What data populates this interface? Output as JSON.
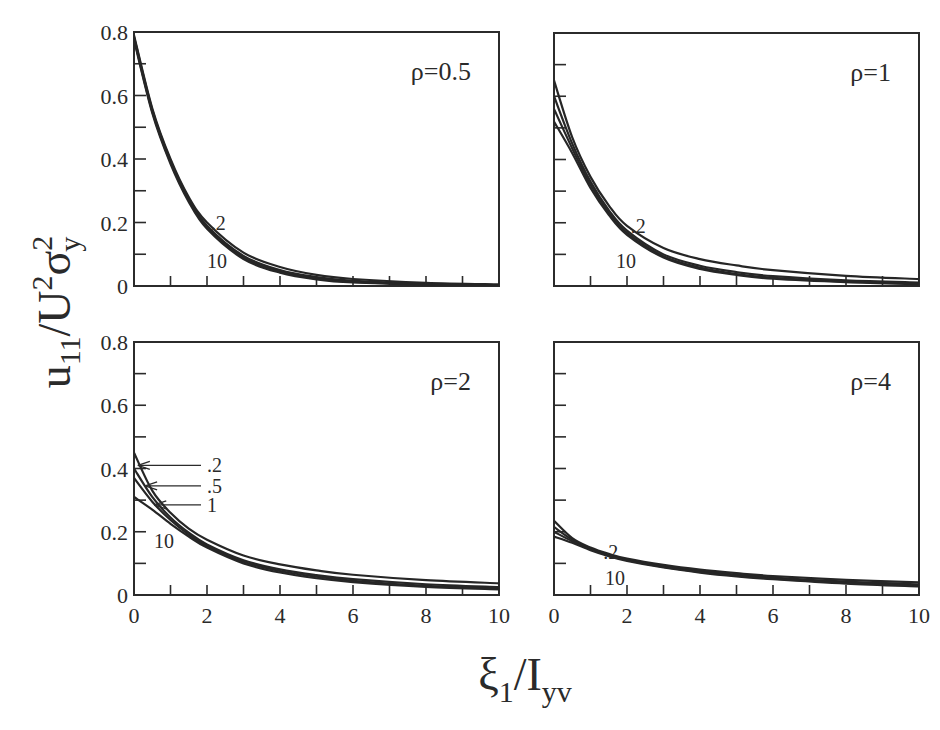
{
  "chart_data": {
    "type": "line",
    "title": "",
    "xlabel": {
      "main": "ξ",
      "sub1": "1",
      "slash": "/I",
      "sub2": "yv"
    },
    "ylabel": {
      "main": "u",
      "sub1": "11",
      "slash": "/U",
      "sup1": "2",
      "sigma": "σ",
      "sup2": "2",
      "sub2": "y"
    },
    "xlim": [
      0,
      10
    ],
    "ylim": [
      0,
      0.8
    ],
    "x_ticks": [
      0,
      2,
      4,
      6,
      8,
      10
    ],
    "x_tick_labels": [
      "0",
      "2",
      "4",
      "6",
      "8",
      "10"
    ],
    "x_minor_ticks": [
      1,
      3,
      5,
      7,
      9
    ],
    "y_ticks": [
      0,
      0.2,
      0.4,
      0.6,
      0.8
    ],
    "y_tick_labels": [
      "0",
      "0.2",
      "0.4",
      "0.6",
      "0.8"
    ],
    "y_minor_ticks": [
      0.1,
      0.3,
      0.5,
      0.7
    ],
    "grid": false,
    "layout": "2x2 shared axes",
    "panels": [
      {
        "id": "rho-0.5",
        "label": "ρ=0.5",
        "position": "top-left",
        "series": [
          {
            "name": ".2",
            "x": [
              0,
              0.5,
              1,
              1.5,
              2,
              3,
              4,
              5,
              6,
              8,
              10
            ],
            "y": [
              0.79,
              0.56,
              0.4,
              0.28,
              0.2,
              0.105,
              0.06,
              0.035,
              0.022,
              0.01,
              0.005
            ]
          },
          {
            "name": ".5",
            "x": [
              0,
              0.5,
              1,
              1.5,
              2,
              3,
              4,
              5,
              6,
              8,
              10
            ],
            "y": [
              0.785,
              0.555,
              0.395,
              0.275,
              0.19,
              0.095,
              0.05,
              0.028,
              0.016,
              0.007,
              0.003
            ]
          },
          {
            "name": "1",
            "x": [
              0,
              0.5,
              1,
              1.5,
              2,
              3,
              4,
              5,
              6,
              8,
              10
            ],
            "y": [
              0.78,
              0.55,
              0.39,
              0.27,
              0.185,
              0.09,
              0.046,
              0.024,
              0.013,
              0.005,
              0.002
            ]
          },
          {
            "name": "10",
            "x": [
              0,
              0.5,
              1,
              1.5,
              2,
              3,
              4,
              5,
              6,
              8,
              10
            ],
            "y": [
              0.775,
              0.545,
              0.385,
              0.265,
              0.18,
              0.085,
              0.042,
              0.021,
              0.011,
              0.004,
              0.001
            ]
          }
        ],
        "annotations": [
          {
            "text": ".2",
            "x": 2.1,
            "y": 0.2
          },
          {
            "text": "10",
            "x": 2.0,
            "y": 0.08
          }
        ]
      },
      {
        "id": "rho-1",
        "label": "ρ=1",
        "position": "top-right",
        "series": [
          {
            "name": ".2",
            "x": [
              0,
              0.5,
              1,
              1.5,
              2,
              3,
              4,
              5,
              6,
              8,
              10
            ],
            "y": [
              0.65,
              0.47,
              0.345,
              0.255,
              0.19,
              0.12,
              0.085,
              0.065,
              0.05,
              0.032,
              0.022
            ]
          },
          {
            "name": ".5",
            "x": [
              0,
              0.5,
              1,
              1.5,
              2,
              3,
              4,
              5,
              6,
              8,
              10
            ],
            "y": [
              0.6,
              0.45,
              0.33,
              0.24,
              0.175,
              0.1,
              0.064,
              0.044,
              0.031,
              0.018,
              0.011
            ]
          },
          {
            "name": "1",
            "x": [
              0,
              0.5,
              1,
              1.5,
              2,
              3,
              4,
              5,
              6,
              8,
              10
            ],
            "y": [
              0.56,
              0.435,
              0.32,
              0.232,
              0.168,
              0.094,
              0.058,
              0.038,
              0.026,
              0.014,
              0.008
            ]
          },
          {
            "name": "10",
            "x": [
              0,
              0.5,
              1,
              1.5,
              2,
              3,
              4,
              5,
              6,
              8,
              10
            ],
            "y": [
              0.52,
              0.42,
              0.31,
              0.225,
              0.162,
              0.09,
              0.054,
              0.035,
              0.023,
              0.012,
              0.006
            ]
          }
        ],
        "annotations": [
          {
            "text": ".2",
            "x": 2.1,
            "y": 0.19
          },
          {
            "text": "10",
            "x": 1.7,
            "y": 0.08
          }
        ]
      },
      {
        "id": "rho-2",
        "label": "ρ=2",
        "position": "bottom-left",
        "series": [
          {
            "name": ".2",
            "x": [
              0,
              0.5,
              1,
              1.5,
              2,
              3,
              4,
              5,
              6,
              8,
              10
            ],
            "y": [
              0.45,
              0.33,
              0.26,
              0.21,
              0.175,
              0.125,
              0.097,
              0.078,
              0.064,
              0.047,
              0.037
            ]
          },
          {
            "name": ".5",
            "x": [
              0,
              0.5,
              1,
              1.5,
              2,
              3,
              4,
              5,
              6,
              8,
              10
            ],
            "y": [
              0.4,
              0.31,
              0.245,
              0.197,
              0.16,
              0.11,
              0.081,
              0.063,
              0.05,
              0.034,
              0.025
            ]
          },
          {
            "name": "1",
            "x": [
              0,
              0.5,
              1,
              1.5,
              2,
              3,
              4,
              5,
              6,
              8,
              10
            ],
            "y": [
              0.37,
              0.295,
              0.237,
              0.191,
              0.155,
              0.105,
              0.076,
              0.058,
              0.045,
              0.029,
              0.021
            ]
          },
          {
            "name": "10",
            "x": [
              0,
              0.5,
              1,
              1.5,
              2,
              3,
              4,
              5,
              6,
              8,
              10
            ],
            "y": [
              0.31,
              0.27,
              0.225,
              0.185,
              0.15,
              0.1,
              0.071,
              0.053,
              0.041,
              0.026,
              0.018
            ]
          }
        ],
        "annotations": [
          {
            "text": ".2",
            "x": 2.0,
            "y": 0.41,
            "arrow_to": [
              0.05,
              0.41
            ]
          },
          {
            "text": ".5",
            "x": 2.0,
            "y": 0.345,
            "arrow_to": [
              0.25,
              0.345
            ]
          },
          {
            "text": "1",
            "x": 2.0,
            "y": 0.285,
            "arrow_to": [
              0.5,
              0.285
            ]
          },
          {
            "text": "10",
            "x": 0.55,
            "y": 0.17
          }
        ]
      },
      {
        "id": "rho-4",
        "label": "ρ=4",
        "position": "bottom-right",
        "series": [
          {
            "name": ".2",
            "x": [
              0,
              0.5,
              1,
              1.5,
              2,
              3,
              4,
              5,
              6,
              8,
              10
            ],
            "y": [
              0.235,
              0.18,
              0.15,
              0.13,
              0.115,
              0.095,
              0.08,
              0.069,
              0.06,
              0.048,
              0.04
            ]
          },
          {
            "name": ".5",
            "x": [
              0,
              0.5,
              1,
              1.5,
              2,
              3,
              4,
              5,
              6,
              8,
              10
            ],
            "y": [
              0.215,
              0.175,
              0.147,
              0.127,
              0.112,
              0.091,
              0.076,
              0.064,
              0.055,
              0.042,
              0.034
            ]
          },
          {
            "name": "1",
            "x": [
              0,
              0.5,
              1,
              1.5,
              2,
              3,
              4,
              5,
              6,
              8,
              10
            ],
            "y": [
              0.2,
              0.17,
              0.145,
              0.125,
              0.11,
              0.089,
              0.073,
              0.061,
              0.052,
              0.039,
              0.03
            ]
          },
          {
            "name": "10",
            "x": [
              0,
              0.5,
              1,
              1.5,
              2,
              3,
              4,
              5,
              6,
              8,
              10
            ],
            "y": [
              0.185,
              0.165,
              0.142,
              0.123,
              0.108,
              0.087,
              0.071,
              0.059,
              0.05,
              0.036,
              0.027
            ]
          }
        ],
        "annotations": [
          {
            "text": ".2",
            "x": 1.35,
            "y": 0.135
          },
          {
            "text": "10",
            "x": 1.4,
            "y": 0.055
          }
        ]
      }
    ]
  }
}
